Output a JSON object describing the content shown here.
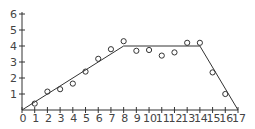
{
  "chart_data": {
    "type": "scatter",
    "title": "",
    "xlabel": "",
    "ylabel": "",
    "xlim": [
      0,
      17
    ],
    "ylim": [
      0,
      6
    ],
    "grid": false,
    "legend": "none",
    "x_ticks": [
      "0",
      "1",
      "2",
      "3",
      "4",
      "5",
      "6",
      "7",
      "8",
      "9",
      "10",
      "11",
      "12",
      "13",
      "14",
      "15",
      "16",
      "17"
    ],
    "y_ticks": [
      "1",
      "2",
      "3",
      "4",
      "5",
      "6"
    ],
    "series": [
      {
        "name": "observed",
        "kind": "scatter",
        "marker": "circle-open",
        "x": [
          1,
          2,
          3,
          4,
          5,
          6,
          7,
          8,
          9,
          10,
          11,
          12,
          13,
          14,
          15,
          16
        ],
        "y": [
          0.4,
          1.15,
          1.3,
          1.65,
          2.4,
          3.2,
          3.8,
          4.3,
          3.7,
          3.75,
          3.4,
          3.6,
          4.2,
          4.2,
          2.35,
          1.0
        ]
      },
      {
        "name": "trapezoid-fit",
        "kind": "line",
        "x": [
          0,
          8,
          14,
          17
        ],
        "y": [
          0,
          4,
          4,
          0
        ]
      }
    ]
  }
}
